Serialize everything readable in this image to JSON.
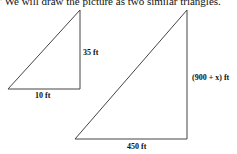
{
  "caption": "' We will draw the picture as two similar triangles.",
  "small_triangle": {
    "height_label": "35 ft",
    "base_label": "10 ft"
  },
  "large_triangle": {
    "height_label": "(900 + x) ft",
    "base_label": "450 ft"
  }
}
